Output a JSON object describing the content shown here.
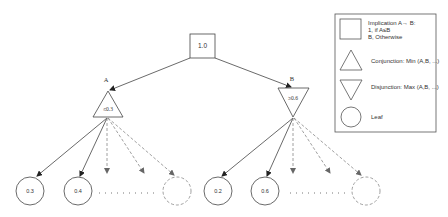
{
  "diagram": {
    "root": {
      "value": "1.0",
      "shape": "square"
    },
    "nodes": [
      {
        "label": "A",
        "value": "≤0.3",
        "shape": "triangle-up"
      },
      {
        "label": "B",
        "value": "≥0.6",
        "shape": "triangle-down"
      }
    ],
    "leaves_A": [
      "0.3",
      "0.4"
    ],
    "leaves_B": [
      "0.2",
      "0.6"
    ],
    "ellipsis": "..........",
    "legend": {
      "implication": {
        "line1": "Implication A→ B:",
        "line2": "1, if A≤B",
        "line3": "B, Otherwise"
      },
      "conjunction": "Conjunction: Min (A,B, ...)",
      "disjunction": "Disjunction: Max (A,B, ...)",
      "leaf": "Leaf"
    },
    "colors": {
      "stroke": "#444444",
      "dashed": "#888888",
      "text": "#333333"
    }
  }
}
